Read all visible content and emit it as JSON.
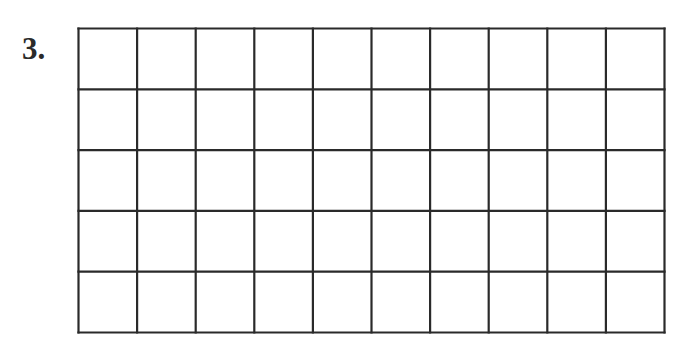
{
  "problem": {
    "number_label": "3."
  },
  "grid": {
    "columns": 10,
    "rows": 5,
    "line_color": "#2a2a2a",
    "shaded_cells": []
  }
}
